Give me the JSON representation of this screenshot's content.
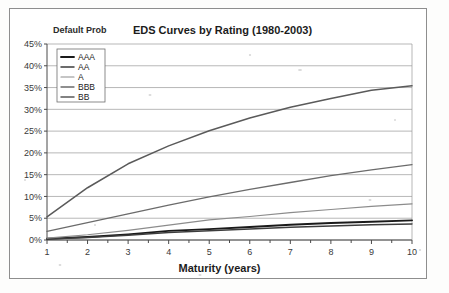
{
  "figure": {
    "kind": "scanned-chart-figure",
    "background_color": "#fdfdfc",
    "frame_color": "#8e8e8e"
  },
  "chart_data": {
    "type": "line",
    "title": "EDS Curves by Rating (1980-2003)",
    "ylabel": "Default Prob",
    "xlabel": "Maturity (years)",
    "x": [
      1,
      2,
      3,
      4,
      5,
      6,
      7,
      8,
      9,
      10
    ],
    "xlim": [
      1,
      10
    ],
    "ylim": [
      0,
      45
    ],
    "yticks": [
      0,
      5,
      10,
      15,
      20,
      25,
      30,
      35,
      40,
      45
    ],
    "ytick_labels": [
      "0%",
      "5%",
      "10%",
      "15%",
      "20%",
      "25%",
      "30%",
      "35%",
      "40%",
      "45%"
    ],
    "xticks": [
      1,
      2,
      3,
      4,
      5,
      6,
      7,
      8,
      9,
      10
    ],
    "xtick_labels": [
      "1",
      "2",
      "3",
      "4",
      "5",
      "6",
      "7",
      "8",
      "9",
      "10"
    ],
    "grid": "horizontal",
    "legend_position": "upper-left-inside",
    "series": [
      {
        "name": "AAA",
        "color": "#1a1a1a",
        "width": 1.9,
        "values": [
          0.3,
          0.7,
          1.3,
          2.1,
          2.5,
          3.0,
          3.5,
          3.9,
          4.2,
          4.5
        ]
      },
      {
        "name": "AA",
        "color": "#3d3d3d",
        "width": 1.5,
        "values": [
          0.25,
          0.6,
          1.1,
          1.7,
          2.1,
          2.5,
          2.9,
          3.2,
          3.5,
          3.7
        ]
      },
      {
        "name": "A",
        "color": "#8c8c8c",
        "width": 1.2,
        "values": [
          0.45,
          1.2,
          2.2,
          3.4,
          4.6,
          5.4,
          6.3,
          7.0,
          7.7,
          8.3
        ]
      },
      {
        "name": "BBB",
        "color": "#6b6b6b",
        "width": 1.3,
        "values": [
          2.0,
          4.0,
          6.0,
          8.0,
          9.9,
          11.6,
          13.2,
          14.8,
          16.1,
          17.3
        ]
      },
      {
        "name": "BB",
        "color": "#5a5a5a",
        "width": 1.5,
        "values": [
          5.3,
          12.0,
          17.5,
          21.6,
          25.1,
          28.0,
          30.5,
          32.5,
          34.4,
          35.4
        ]
      }
    ]
  }
}
